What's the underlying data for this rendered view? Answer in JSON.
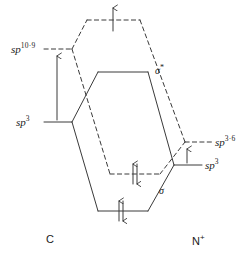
{
  "diagram": {
    "type": "molecular-orbital-energy-diagram",
    "background_color": "#ffffff",
    "line_color": "#3a3a3a",
    "text_color": "#1a1a1a"
  },
  "atoms": {
    "left": {
      "label": "C",
      "label_sup": ""
    },
    "right": {
      "label": "N",
      "label_sup": "+"
    }
  },
  "atomic_levels": [
    {
      "id": "left-sp-10-9",
      "side": "left",
      "base": "sp",
      "exponent": "10·9",
      "style": "dashed",
      "y": 49
    },
    {
      "id": "left-sp-3",
      "side": "left",
      "base": "sp",
      "exponent": "3",
      "style": "solid",
      "y": 122
    },
    {
      "id": "right-sp-3-6",
      "side": "right",
      "base": "sp",
      "exponent": "3·6",
      "style": "dashed",
      "y": 142
    },
    {
      "id": "right-sp-3",
      "side": "right",
      "base": "sp",
      "exponent": "3",
      "style": "solid",
      "y": 165
    }
  ],
  "molecular_levels": [
    {
      "id": "sigma-star-dashed",
      "label": "",
      "style": "dashed",
      "kind": "antibonding",
      "y": 20,
      "electrons": "single-up"
    },
    {
      "id": "sigma-star-solid",
      "label": "σ",
      "label_sup": "*",
      "style": "solid",
      "kind": "antibonding",
      "y": 72,
      "electrons": "none"
    },
    {
      "id": "sigma-dashed",
      "label": "",
      "style": "dashed",
      "kind": "bonding",
      "y": 174,
      "electrons": "paired"
    },
    {
      "id": "sigma-solid",
      "label": "σ",
      "label_sup": "",
      "style": "solid",
      "kind": "bonding",
      "y": 211,
      "electrons": "paired"
    }
  ],
  "labels": {
    "left_upper_orbital": "sp",
    "left_upper_exponent": "10·9",
    "left_lower_orbital": "sp",
    "left_lower_exponent": "3",
    "right_upper_orbital": "sp",
    "right_upper_exponent": "3·6",
    "right_lower_orbital": "sp",
    "right_lower_exponent": "3",
    "sigma_star": "σ",
    "sigma_star_sup": "*",
    "sigma": "σ",
    "atom_left": "C",
    "atom_right": "N",
    "atom_right_sup": "+"
  },
  "promotion_arrows": [
    {
      "id": "left-promotion-arrow",
      "side": "left",
      "from_level": "left-sp-3",
      "to_level": "left-sp-10-9",
      "direction": "up"
    },
    {
      "id": "right-promotion-arrow",
      "side": "right",
      "from_level": "right-sp-3",
      "to_level": "right-sp-3-6",
      "direction": "up"
    }
  ],
  "electron_arrows": [
    {
      "id": "e-sigma-star-dashed",
      "level": "sigma-star-dashed",
      "count": 1,
      "spins": [
        "up"
      ]
    },
    {
      "id": "e-sigma-dashed",
      "level": "sigma-dashed",
      "count": 2,
      "spins": [
        "up",
        "down"
      ]
    },
    {
      "id": "e-sigma-solid",
      "level": "sigma-solid",
      "count": 2,
      "spins": [
        "up",
        "down"
      ]
    }
  ]
}
